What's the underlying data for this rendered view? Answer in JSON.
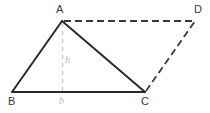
{
  "figure": {
    "background_color": "#ffffff",
    "solid_stroke_color": "#2a2a2a",
    "dashed_stroke_color": "#3a3a3a",
    "height_line_color": "#c8c8c8",
    "vertex_label_color": "#3a3a3a",
    "measure_label_color": "#b9b9b9",
    "labels": {
      "vertex_a": "A",
      "vertex_b": "B",
      "vertex_c": "C",
      "vertex_d": "D",
      "height": "h",
      "base": "b"
    },
    "points": {
      "A": {
        "x": 62,
        "y": 21
      },
      "B": {
        "x": 12,
        "y": 92
      },
      "C": {
        "x": 145,
        "y": 92
      },
      "D": {
        "x": 195,
        "y": 21
      },
      "foot": {
        "x": 62,
        "y": 92
      }
    },
    "edges": {
      "ab": "M 62 21 L 12 92",
      "bc": "M 12 92 L 145 92",
      "ca": "M 145 92 L 62 21",
      "ad": "M 63 21 L 195 21",
      "cd": "M 145 92 L 195 21",
      "height": "M 62 23 L 62 91"
    }
  }
}
